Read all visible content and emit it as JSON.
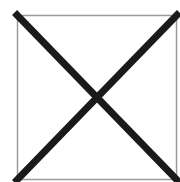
{
  "placeholder": {
    "icon": "image-placeholder-x-icon",
    "box": {
      "x": 17,
      "y": 15,
      "width": 160,
      "height": 165
    },
    "border_color": "#9a9a9a",
    "cross_color": "#1a1a1a",
    "cross_width": 7,
    "background": "#ffffff"
  }
}
